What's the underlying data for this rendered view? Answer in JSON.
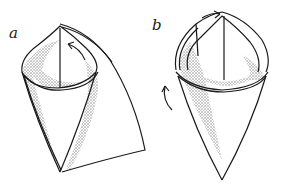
{
  "illustration": {
    "subject": "paper cone folding steps",
    "figures": [
      {
        "label": "a",
        "description": "cone formed with flap extending right, arrow showing curl direction"
      },
      {
        "label": "b",
        "description": "cone with flap wrapped around, arrows showing wrap direction"
      }
    ]
  },
  "colors": {
    "ink": "#1a1a1a",
    "shade": "#8c8c8c",
    "paper": "#ffffff"
  }
}
